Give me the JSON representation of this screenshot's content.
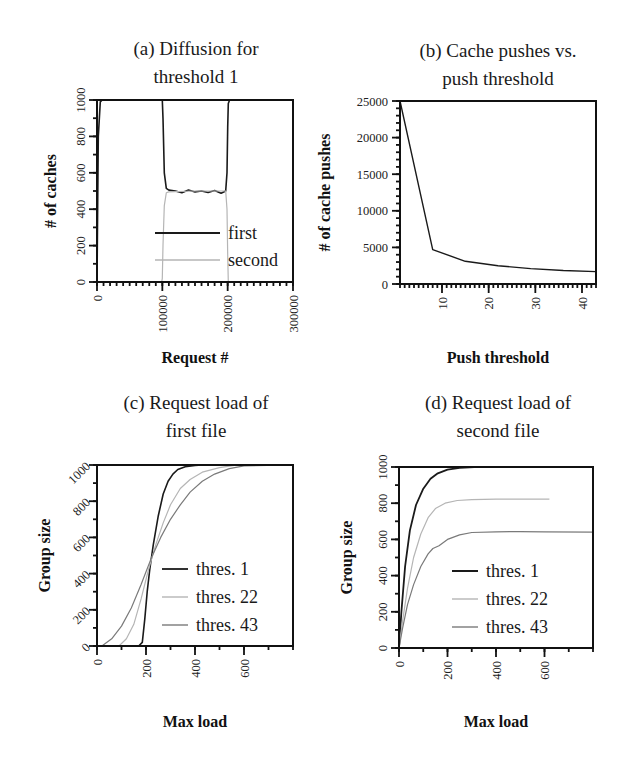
{
  "figure": {
    "panels": [
      "a",
      "b",
      "c",
      "d"
    ]
  },
  "chart_data": [
    {
      "id": "a",
      "type": "line",
      "title": [
        "(a) Diffusion for",
        "threshold 1"
      ],
      "xlabel": "Request #",
      "ylabel": "# of caches",
      "xlim": [
        0,
        300000
      ],
      "ylim": [
        0,
        1000
      ],
      "xticks": [
        0,
        100000,
        200000,
        300000
      ],
      "yticks": [
        0,
        200,
        400,
        600,
        800,
        1000
      ],
      "xtick_rotation": -90,
      "ytick_rotation": -90,
      "grid": false,
      "legend_position": "lower center",
      "series": [
        {
          "name": "first",
          "color": "#1a1a1a",
          "width": 1.6,
          "x": [
            0,
            2000,
            5000,
            8000,
            100000,
            101000,
            103000,
            106000,
            110000,
            120000,
            130000,
            140000,
            150000,
            160000,
            170000,
            180000,
            190000,
            197000,
            199000,
            200000,
            201000,
            203000,
            300000
          ],
          "y": [
            0,
            800,
            990,
            1000,
            1000,
            900,
            600,
            515,
            505,
            500,
            490,
            505,
            495,
            500,
            492,
            503,
            488,
            500,
            600,
            850,
            980,
            1000,
            1000
          ]
        },
        {
          "name": "second",
          "color": "#b5b5b5",
          "width": 1.2,
          "x": [
            0,
            99000,
            100000,
            101000,
            103000,
            106000,
            110000,
            150000,
            190000,
            197000,
            199000,
            200000,
            201000,
            300000
          ],
          "y": [
            0,
            0,
            20,
            200,
            420,
            490,
            495,
            500,
            500,
            500,
            400,
            150,
            0,
            0
          ]
        }
      ]
    },
    {
      "id": "b",
      "type": "line",
      "title": [
        "(b) Cache pushes vs.",
        "push threshold"
      ],
      "xlabel": "Push threshold",
      "ylabel": "# of cache pushes",
      "xlim": [
        1,
        43
      ],
      "ylim": [
        0,
        25000
      ],
      "xticks": [
        10,
        20,
        30,
        40
      ],
      "yticks": [
        0,
        5000,
        10000,
        15000,
        20000,
        25000
      ],
      "xtick_rotation": -90,
      "ytick_rotation": 0,
      "grid": false,
      "series": [
        {
          "name": "pushes",
          "color": "#1a1a1a",
          "width": 1.4,
          "x": [
            1,
            8,
            15,
            22,
            29,
            36,
            43
          ],
          "y": [
            25000,
            4700,
            3100,
            2500,
            2100,
            1850,
            1700
          ]
        }
      ]
    },
    {
      "id": "c",
      "type": "line",
      "title": [
        "(c) Request load of",
        "first file"
      ],
      "xlabel": "Max load",
      "ylabel": "Group size",
      "xlim": [
        0,
        800
      ],
      "ylim": [
        0,
        1000
      ],
      "xticks": [
        0,
        200,
        400,
        600
      ],
      "yticks": [
        0,
        200,
        400,
        600,
        800,
        1000
      ],
      "xtick_rotation": -90,
      "ytick_rotation": -45,
      "grid": false,
      "legend_position": "center right",
      "series": [
        {
          "name": "thres. 1",
          "color": "#1a1a1a",
          "width": 1.6,
          "x": [
            0,
            170,
            185,
            195,
            205,
            215,
            230,
            250,
            270,
            290,
            310,
            330,
            360,
            400,
            430,
            800
          ],
          "y": [
            0,
            0,
            20,
            150,
            300,
            420,
            560,
            720,
            840,
            910,
            950,
            975,
            990,
            998,
            1000,
            1000
          ]
        },
        {
          "name": "thres. 22",
          "color": "#b5b5b5",
          "width": 1.2,
          "x": [
            0,
            90,
            120,
            150,
            180,
            210,
            240,
            270,
            300,
            340,
            380,
            430,
            500,
            560,
            800
          ],
          "y": [
            0,
            0,
            40,
            120,
            260,
            420,
            560,
            680,
            780,
            870,
            920,
            960,
            985,
            998,
            1000
          ]
        },
        {
          "name": "thres. 43",
          "color": "#7a7a7a",
          "width": 1.2,
          "x": [
            0,
            20,
            60,
            100,
            140,
            180,
            220,
            260,
            300,
            340,
            380,
            430,
            480,
            540,
            600,
            800
          ],
          "y": [
            0,
            0,
            40,
            110,
            210,
            340,
            480,
            600,
            700,
            780,
            850,
            910,
            950,
            980,
            995,
            1000
          ]
        }
      ]
    },
    {
      "id": "d",
      "type": "line",
      "title": [
        "(d) Request load of",
        "second file"
      ],
      "xlabel": "Max load",
      "ylabel": "Group size",
      "xlim": [
        0,
        800
      ],
      "ylim": [
        0,
        1000
      ],
      "xticks": [
        0,
        200,
        400,
        600
      ],
      "yticks": [
        0,
        200,
        400,
        600,
        800,
        1000
      ],
      "xtick_rotation": -90,
      "ytick_rotation": -90,
      "grid": false,
      "legend_position": "lower right",
      "series": [
        {
          "name": "thres. 1",
          "color": "#1a1a1a",
          "width": 1.8,
          "x": [
            0,
            10,
            25,
            45,
            70,
            100,
            130,
            160,
            200,
            250,
            310
          ],
          "y": [
            0,
            200,
            450,
            650,
            790,
            880,
            935,
            965,
            985,
            995,
            1000
          ]
        },
        {
          "name": "thres. 22",
          "color": "#b5b5b5",
          "width": 1.2,
          "x": [
            0,
            15,
            35,
            60,
            90,
            120,
            150,
            190,
            240,
            300,
            400,
            500,
            620
          ],
          "y": [
            0,
            150,
            330,
            500,
            630,
            720,
            770,
            800,
            815,
            820,
            822,
            822,
            822
          ]
        },
        {
          "name": "thres. 43",
          "color": "#7a7a7a",
          "width": 1.2,
          "x": [
            0,
            15,
            35,
            60,
            90,
            120,
            140,
            165,
            200,
            250,
            300,
            400,
            500,
            600,
            800
          ],
          "y": [
            0,
            110,
            240,
            350,
            450,
            520,
            550,
            565,
            600,
            625,
            638,
            642,
            643,
            642,
            640
          ]
        }
      ]
    }
  ],
  "layout": {
    "a": {
      "left": 97,
      "top": 100,
      "right": 293,
      "bottom": 282,
      "title_x": 196,
      "title_y": [
        55,
        83
      ],
      "xlabel_y": 363,
      "ylabel_x": 56,
      "minor_x": 30,
      "minor_y": 10
    },
    "b": {
      "left": 400,
      "top": 101,
      "right": 596,
      "bottom": 284,
      "title_x": 498,
      "title_y": [
        57,
        85
      ],
      "xlabel_y": 363,
      "ylabel_x": 330,
      "minor_x": 42,
      "minor_y": 25
    },
    "c": {
      "left": 97,
      "top": 465,
      "right": 293,
      "bottom": 646,
      "title_x": 196,
      "title_y": [
        409,
        437
      ],
      "xlabel_y": 727,
      "ylabel_x": 50,
      "minor_x": 8,
      "minor_y": 10
    },
    "d": {
      "left": 399,
      "top": 467,
      "right": 593,
      "bottom": 648,
      "title_x": 498,
      "title_y": [
        409,
        437
      ],
      "xlabel_y": 727,
      "ylabel_x": 352,
      "minor_x": 8,
      "minor_y": 10
    }
  }
}
